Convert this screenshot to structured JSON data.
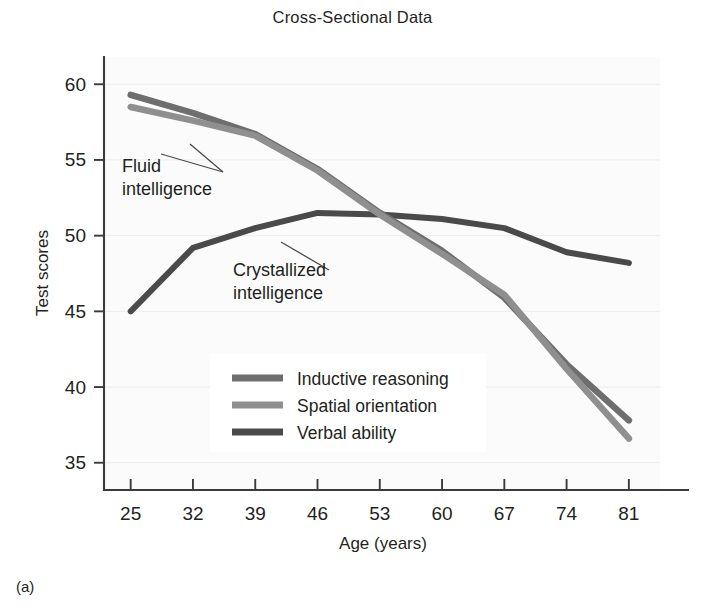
{
  "figure": {
    "title": "Cross-Sectional Data",
    "panel_label": "(a)"
  },
  "chart_data": {
    "type": "line",
    "title": "Cross-Sectional Data",
    "xlabel": "Age (years)",
    "ylabel": "Test scores",
    "x": [
      25,
      32,
      39,
      46,
      53,
      60,
      67,
      74,
      81
    ],
    "xtick_labels": [
      "25",
      "32",
      "39",
      "46",
      "53",
      "60",
      "67",
      "74",
      "81"
    ],
    "ytick_labels": [
      "35",
      "40",
      "45",
      "50",
      "55",
      "60"
    ],
    "yticks": [
      35,
      40,
      45,
      50,
      55,
      60
    ],
    "ylim": [
      33.2,
      61.8
    ],
    "xlim": [
      22.0,
      84.5
    ],
    "grid": false,
    "legend_position": "center",
    "series": [
      {
        "name": "Inductive reasoning",
        "color": "#6e6e6e",
        "values": [
          59.3,
          58.1,
          56.7,
          54.4,
          51.5,
          49.0,
          45.9,
          41.5,
          37.8
        ]
      },
      {
        "name": "Spatial orientation",
        "color": "#8f8f8f",
        "values": [
          58.5,
          57.6,
          56.6,
          54.3,
          51.4,
          48.8,
          46.1,
          41.2,
          36.6
        ]
      },
      {
        "name": "Verbal ability",
        "color": "#4a4a4a",
        "values": [
          45.0,
          49.2,
          50.5,
          51.5,
          51.4,
          51.1,
          50.5,
          48.9,
          48.2
        ]
      }
    ],
    "annotations": [
      {
        "text_line1": "Fluid",
        "text_line2": "intelligence",
        "target": "Inductive reasoning / Spatial orientation"
      },
      {
        "text_line1": "Crystallized",
        "text_line2": "intelligence",
        "target": "Verbal ability"
      }
    ]
  }
}
